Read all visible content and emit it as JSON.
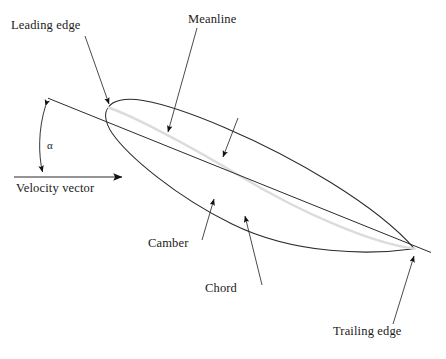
{
  "diagram": {
    "background_color": "#ffffff",
    "line_color": "#2b2b2b",
    "meanline_color": "#dcdcdc",
    "text_color": "#1a1a1a"
  },
  "labels": {
    "leading_edge": "Leading edge",
    "meanline": "Meanline",
    "velocity_vector": "Velocity vector",
    "camber": "Camber",
    "chord": "Chord",
    "trailing_edge": "Trailing edge",
    "alpha": "α"
  },
  "geometry": {
    "leading_edge_point": [
      108,
      107
    ],
    "trailing_edge_point": [
      414,
      249
    ],
    "chord_line_start": [
      48,
      98
    ],
    "chord_line_end": [
      431,
      252
    ],
    "velocity_line_start": [
      14,
      177
    ],
    "velocity_line_end": [
      130,
      177
    ],
    "angle_of_attack_arc": "alpha between chord line and velocity vector"
  },
  "annotations": [
    {
      "name": "leading-edge",
      "label": "Leading edge",
      "arrow_from": [
        85,
        35
      ],
      "arrow_to": [
        110,
        108
      ]
    },
    {
      "name": "meanline",
      "label": "Meanline",
      "arrow_from": [
        197,
        28
      ],
      "arrow_to": [
        167,
        136
      ]
    },
    {
      "name": "upper-surface",
      "label": "",
      "arrow_from": [
        238,
        119
      ],
      "arrow_to": [
        222,
        160
      ]
    },
    {
      "name": "camber",
      "label": "Camber",
      "arrow_from": [
        202,
        238
      ],
      "arrow_to": [
        214,
        196
      ]
    },
    {
      "name": "chord",
      "label": "Chord",
      "arrow_from": [
        262,
        283
      ],
      "arrow_to": [
        244,
        213
      ]
    },
    {
      "name": "trailing-edge",
      "label": "Trailing edge",
      "arrow_from": [
        393,
        323
      ],
      "arrow_to": [
        414,
        253
      ]
    }
  ]
}
